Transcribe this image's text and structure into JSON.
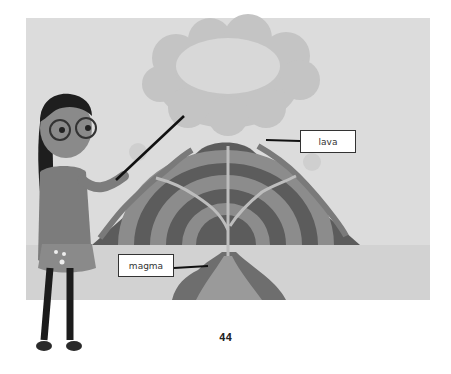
{
  "labels": {
    "lava": "lava",
    "magma": "magma"
  },
  "page": {
    "number": "44"
  },
  "illustration": {
    "subject": "volcano cross-section",
    "figure": "girl with glasses pointing"
  },
  "colors": {
    "background": "#dcdcdc",
    "ground": "#d2d2d2",
    "volcano_dark": "#5a5a5a",
    "volcano_light": "#8a8a8a",
    "ash_cloud": "#c8c8c8",
    "label_border": "#333333"
  }
}
